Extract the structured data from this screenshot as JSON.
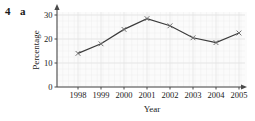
{
  "exercise": {
    "number": "4",
    "part": "a"
  },
  "chart_data": {
    "type": "line",
    "title": "",
    "xlabel": "Year",
    "ylabel": "Percentage",
    "categories": [
      "1998",
      "1999",
      "2000",
      "2001",
      "2002",
      "2003",
      "2004",
      "2005"
    ],
    "values": [
      14,
      18,
      24,
      28.5,
      25.5,
      20.5,
      18.5,
      22.5
    ],
    "series": [
      {
        "name": "Percentage",
        "values": [
          14,
          18,
          24,
          28.5,
          25.5,
          20.5,
          18.5,
          22.5
        ]
      }
    ],
    "ylim": [
      0,
      32
    ],
    "yticks": [
      "0",
      "10",
      "20",
      "30"
    ],
    "ytick_values": [
      0,
      10,
      20,
      30
    ],
    "xlim": [
      0,
      9
    ],
    "grid": true,
    "legend": "none",
    "marker": "cross",
    "line_color": "#3b3b3b",
    "marker_color": "#707070",
    "grid_color": "#e3e3e3",
    "axis_color": "#4a4a4a",
    "plot_bg": "#fbfbfb"
  }
}
